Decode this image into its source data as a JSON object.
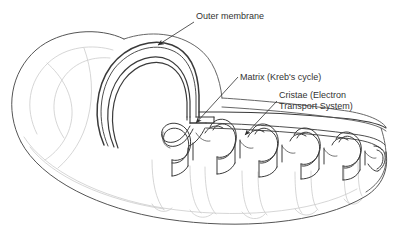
{
  "figure": {
    "kind": "biology-diagram",
    "background_color": "#ffffff",
    "ink_color": "#3a3a3a",
    "faint_ink_color": "#c8c8c8",
    "text_color": "#333333"
  },
  "labels": [
    {
      "id": "outer-membrane",
      "text": "Outer membrane",
      "lines": [
        "Outer membrane"
      ],
      "x": 196,
      "y": 11
    },
    {
      "id": "matrix",
      "text": "Matrix (Kreb's cycle)",
      "lines": [
        "Matrix (Kreb's cycle)"
      ],
      "x": 240,
      "y": 72
    },
    {
      "id": "cristae",
      "text": "Cristae (Electron Transport System)",
      "lines": [
        "Cristae (Electron",
        "Transport System)"
      ],
      "x": 279,
      "y": 90
    }
  ],
  "leaders": [
    {
      "id": "leader-outer-membrane",
      "points": "194,22 156,46",
      "arrow_at": [
        156,
        46
      ]
    },
    {
      "id": "leader-matrix",
      "points": "238,77 194,124",
      "arrow_at": [
        194,
        124
      ]
    },
    {
      "id": "leader-cristae",
      "points": "277,101 243,136",
      "arrow_at": [
        243,
        136
      ]
    }
  ],
  "structures": {
    "outer_membrane": "outer bounding membrane of the organelle",
    "inner_membrane": "inner membrane running parallel inside the outer membrane",
    "matrix": "interior space enclosed by the inner membrane",
    "cristae": "wavy infoldings of the inner membrane, 6 folds visible"
  }
}
